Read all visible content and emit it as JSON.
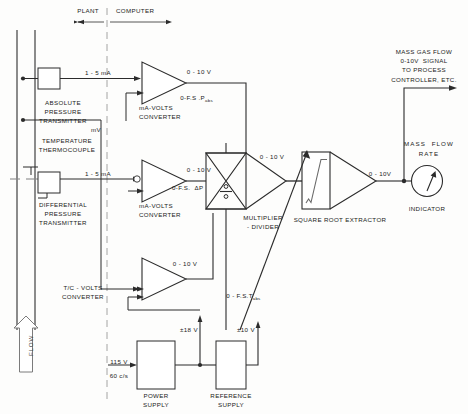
{
  "diagram": {
    "domain_labels": {
      "plant": "PLANT",
      "computer": "COMPUTER"
    },
    "process": {
      "flow_label": "FLOW",
      "absolute_pressure_transmitter": "ABSOLUTE\nPRESSURE\nTRANSMITTER",
      "temperature_thermocouple": "TEMPERATURE\nTHERMOCOUPLE",
      "differential_pressure_transmitter": "DIFFERENTIAL\nPRESSURE\nTRANSMITTER"
    },
    "signals": {
      "ap_current": "1 - 5 mA",
      "tc_millivolt": "mV",
      "dp_current": "1 - 5 mA",
      "ap_out_volts": "0 - 10 V",
      "dp_out_volts": "0 - 10 V",
      "tc_out_volts": "0 - 10 V",
      "ap_range": "0-F.S .P",
      "ap_range_sub": "abs",
      "dp_range": "0-F.S.  ΔP",
      "tc_range": "0 - F.S.T",
      "tc_range_sub": "abs",
      "multiplier_out": "0 - 10 V",
      "sqrt_out": "0 - 10V",
      "mains_voltage": "115 V",
      "mains_frequency": "60 c/s",
      "power_supply_out": "±18 V",
      "reference_supply_out": "±10 V"
    },
    "converters": {
      "ap_converter": "mA-VOLTS\nCONVERTER",
      "dp_converter": "mA-VOLTS\nCONVERTER",
      "tc_converter": "T/C - VOLTS\nCONVERTER"
    },
    "compute_blocks": {
      "multiplier_divider": "MULTIPLIER\n- DIVIDER",
      "square_root_extractor": "SQUARE ROOT EXTRACTOR"
    },
    "supplies": {
      "power_supply": "POWER\nSUPPLY",
      "reference_supply": "REFERENCE\nSUPPLY"
    },
    "output": {
      "mass_gas_flow_note": "MASS GAS FLOW\n0-10V  SIGNAL\nTO PROCESS\nCONTROLLER, ETC.",
      "mass_flow_rate": "MASS  FLOW\nRATE",
      "indicator": "INDICATOR"
    },
    "colors": {
      "line": "#2b2b2b",
      "pipe": "#6e6e6e",
      "divider": "#9a9a9a",
      "text": "#1b1b1b",
      "background": "#fdfdfc"
    }
  }
}
